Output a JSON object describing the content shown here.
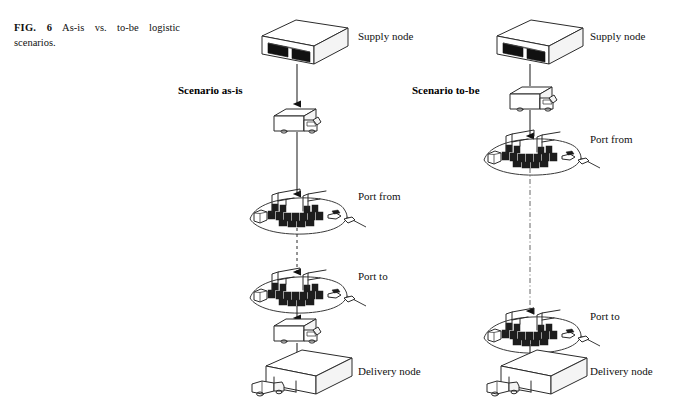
{
  "figure": {
    "number_label": "FIG. 6",
    "caption_text": "As-is vs. to-be logistic scenarios.",
    "caption_full": "FIG. 6  As-is vs. to-be logistic scenarios."
  },
  "scenarios": [
    {
      "id": "as-is",
      "title": "Scenario as-is",
      "column": "left",
      "nodes": [
        {
          "key": "supply",
          "label": "Supply node",
          "icon": "warehouse-icon",
          "y": 38
        },
        {
          "key": "portfrom",
          "label": "Port from",
          "icon": "port-terminal-icon",
          "y": 198
        },
        {
          "key": "portto",
          "label": "Port to",
          "icon": "port-terminal-icon",
          "y": 278
        },
        {
          "key": "delivery",
          "label": "Delivery node",
          "icon": "warehouse-dock-icon",
          "y": 372
        }
      ],
      "legs": [
        {
          "from": "supply",
          "to": "portfrom",
          "mode": "road",
          "icon": "truck-icon",
          "style": "solid-arrow"
        },
        {
          "from": "portfrom",
          "to": "portto",
          "mode": "sea",
          "icon": "ship-leg",
          "style": "dashed-arrow"
        },
        {
          "from": "portto",
          "to": "delivery",
          "mode": "road",
          "icon": "truck-icon",
          "style": "solid-arrow"
        }
      ]
    },
    {
      "id": "to-be",
      "title": "Scenario to-be",
      "column": "right",
      "nodes": [
        {
          "key": "supply",
          "label": "Supply node",
          "icon": "warehouse-icon",
          "y": 38
        },
        {
          "key": "portfrom",
          "label": "Port from",
          "icon": "port-terminal-icon",
          "y": 140
        },
        {
          "key": "portto",
          "label": "Port to",
          "icon": "port-terminal-icon",
          "y": 317
        },
        {
          "key": "delivery",
          "label": "Delivery node",
          "icon": "warehouse-dock-icon",
          "y": 372
        }
      ],
      "legs": [
        {
          "from": "supply",
          "to": "portfrom",
          "mode": "road",
          "icon": "truck-icon",
          "style": "solid-arrow"
        },
        {
          "from": "portfrom",
          "to": "portto",
          "mode": "sea",
          "icon": "ship-leg",
          "style": "dashed-arrow"
        },
        {
          "from": "portto",
          "to": "delivery",
          "mode": "road",
          "icon": "none",
          "style": "solid-arrow"
        }
      ]
    }
  ],
  "labels": {
    "left": {
      "supply": "Supply node",
      "port_from": "Port from",
      "port_to": "Port to",
      "delivery": "Delivery node"
    },
    "right": {
      "supply": "Supply node",
      "port_from": "Port from",
      "port_to": "Port to",
      "delivery": "Delivery node"
    }
  },
  "colors": {
    "background": "#ffffff",
    "line": "#2b2b2b",
    "fill_dark": "#111111",
    "text": "#1a1a1a",
    "shade": "#f4f4f4"
  }
}
